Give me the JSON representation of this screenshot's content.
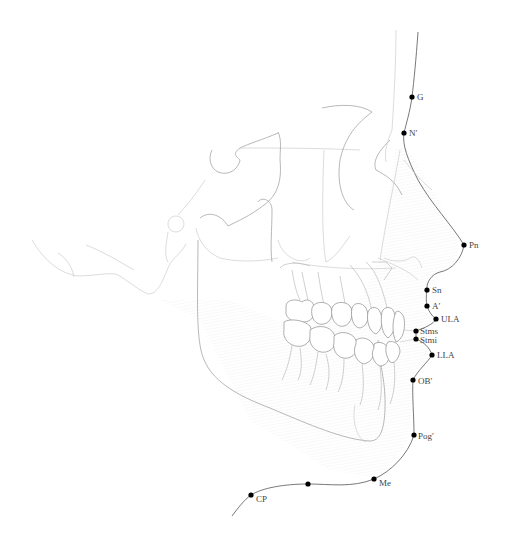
{
  "diagram": {
    "type": "cephalometric-soft-tissue-tracing",
    "orientation": "lateral-profile-facing-right"
  },
  "landmarks": [
    {
      "id": "G",
      "label": "G",
      "x": 412,
      "y": 97
    },
    {
      "id": "N_prime",
      "label": "N′",
      "x": 404,
      "y": 133
    },
    {
      "id": "Pn",
      "label": "Pn",
      "x": 464,
      "y": 245
    },
    {
      "id": "Sn",
      "label": "Sn",
      "x": 427,
      "y": 290
    },
    {
      "id": "A_prime",
      "label": "A′",
      "x": 427,
      "y": 306
    },
    {
      "id": "ULA",
      "label": "ULA",
      "x": 436,
      "y": 319
    },
    {
      "id": "Stms",
      "label": "Stms",
      "x": 416,
      "y": 331
    },
    {
      "id": "Stmi",
      "label": "Stmi",
      "x": 416,
      "y": 339
    },
    {
      "id": "LLA",
      "label": "LLA",
      "x": 432,
      "y": 355
    },
    {
      "id": "OB_prime",
      "label": "OB′",
      "x": 413,
      "y": 380
    },
    {
      "id": "Pog_prime",
      "label": "Pog′",
      "x": 414,
      "y": 435
    },
    {
      "id": "Me",
      "label": "Me",
      "x": 374,
      "y": 479
    },
    {
      "id": "unlabeled",
      "label": "",
      "x": 308,
      "y": 484
    },
    {
      "id": "CP",
      "label": "CP",
      "x": 251,
      "y": 495
    }
  ],
  "colors": {
    "profile_line": "#555555",
    "bone_line": "#9a9a9a",
    "landmark_dot": "#000000",
    "label_text": "#444444",
    "background": "#ffffff"
  }
}
